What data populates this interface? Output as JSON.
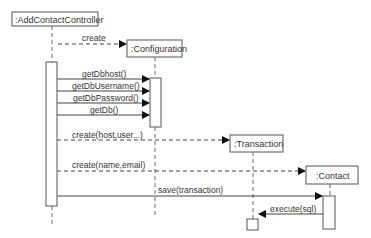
{
  "diagram": {
    "type": "UML sequence diagram",
    "participants": [
      {
        "id": "controller",
        "label": ":AddContactController"
      },
      {
        "id": "configuration",
        "label": ":Configuration"
      },
      {
        "id": "transaction",
        "label": ":Transaction"
      },
      {
        "id": "contact",
        "label": ":Contact"
      }
    ],
    "messages": [
      {
        "from": "controller",
        "to": "configuration",
        "label": "create",
        "style": "dashed"
      },
      {
        "from": "controller",
        "to": "configuration",
        "label": "getDbhost()",
        "style": "solid"
      },
      {
        "from": "controller",
        "to": "configuration",
        "label": "getDbUsername()",
        "style": "solid"
      },
      {
        "from": "controller",
        "to": "configuration",
        "label": "getDbPassword()",
        "style": "solid"
      },
      {
        "from": "controller",
        "to": "configuration",
        "label": "getDb()",
        "style": "solid"
      },
      {
        "from": "controller",
        "to": "transaction",
        "label": "create(host,user...)",
        "style": "dashed"
      },
      {
        "from": "controller",
        "to": "contact",
        "label": "create(name,email)",
        "style": "dashed"
      },
      {
        "from": "controller",
        "to": "contact",
        "label": "save(transaction)",
        "style": "solid"
      },
      {
        "from": "contact",
        "to": "transaction",
        "label": "execute(sql)",
        "style": "solid"
      }
    ]
  },
  "colors": {
    "line": "#555555",
    "text": "#333333",
    "background": "#ffffff"
  }
}
